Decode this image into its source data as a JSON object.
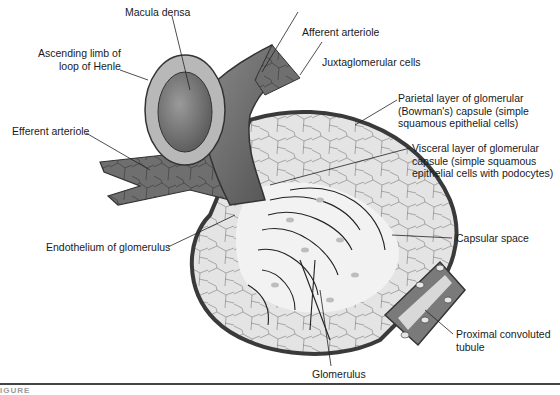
{
  "diagram": {
    "labels": {
      "macula_densa": "Macula densa",
      "ascending_limb": "Ascending limb of\nloop of Henle",
      "efferent_arteriole": "Efferent arteriole",
      "afferent_arteriole": "Afferent arteriole",
      "juxtaglomerular_cells": "Juxtaglomerular cells",
      "parietal_layer": "Parietal layer of glomerular\n(Bowman's) capsule (simple\nsquamous epithelial cells)",
      "visceral_layer": "Visceral layer of glomerular\ncapsule (simple squamous\nepithelial cells with podocytes)",
      "endothelium": "Endothelium of glomerulus",
      "capsular_space": "Capsular space",
      "proximal_tubule": "Proximal convoluted\ntubule",
      "glomerulus": "Glomerulus"
    },
    "caption_fragment": "IGURE"
  }
}
